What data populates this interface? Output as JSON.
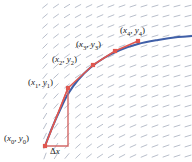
{
  "figure": {
    "name": "euler-method-slope-field",
    "background": "#ffffff",
    "width": 192,
    "height": 162
  },
  "colors": {
    "slope_field": "#b9bfcc",
    "solution_curve": "#3f5fa8",
    "euler_polyline": "#e0574f",
    "marker": "#e0574f",
    "delta_triangle": "#d46a68",
    "label_text": "#1a1a1a"
  },
  "labels": {
    "p0": "(x0, y0)",
    "p1": "(x1, y1)",
    "p2": "(x2, y2)",
    "p3": "(x3, y3)",
    "p4": "(x4, y4)",
    "delta_x": "Δx"
  },
  "chart_data": {
    "type": "line",
    "title": "",
    "xlabel": "",
    "ylabel": "",
    "grid": false,
    "legend": null,
    "xlim": [
      0,
      192
    ],
    "ylim": [
      162,
      0
    ],
    "series": [
      {
        "name": "solution-curve",
        "style": "smooth-curve",
        "color": "#3f5fa8",
        "points": [
          [
            45,
            146
          ],
          [
            52,
            128
          ],
          [
            60,
            110
          ],
          [
            68,
            94
          ],
          [
            78,
            80
          ],
          [
            90,
            68
          ],
          [
            104,
            58
          ],
          [
            120,
            50
          ],
          [
            138,
            44
          ],
          [
            158,
            40
          ],
          [
            178,
            37
          ],
          [
            192,
            36
          ]
        ]
      },
      {
        "name": "euler-polyline",
        "style": "straight-segments-with-square-markers",
        "color": "#e0574f",
        "points": [
          [
            45,
            146
          ],
          [
            68,
            88
          ],
          [
            93,
            65
          ],
          [
            115,
            51
          ],
          [
            138,
            41
          ]
        ],
        "point_labels": [
          "(x0, y0)",
          "(x1, y1)",
          "(x2, y2)",
          "(x3, y3)",
          "(x4, y4)"
        ]
      },
      {
        "name": "delta-x-triangle",
        "style": "right-triangle",
        "color": "#d46a68",
        "vertices": [
          [
            45,
            146
          ],
          [
            68,
            88
          ],
          [
            68,
            146
          ]
        ]
      }
    ],
    "slope_field": {
      "description": "short dashes whose slope decreases from steep at lower-left to nearly flat at upper-right",
      "color": "#b9bfcc",
      "x_start": 45,
      "x_end": 188,
      "y_start": 6,
      "y_end": 156,
      "step_x": 11,
      "step_y": 10,
      "dash_length": 7
    }
  }
}
